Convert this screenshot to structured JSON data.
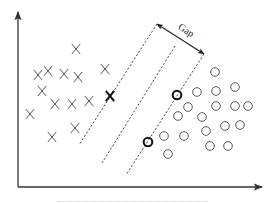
{
  "figure": {
    "type": "svm-hard-margin-diagram",
    "gap_label": "Gap",
    "caption_visible": "cropped, illegible",
    "colors": {
      "ink": "#222222",
      "axis": "#333333",
      "dashed": "#333333",
      "background": "#ffffff"
    },
    "axes": {
      "origin": [
        18,
        187
      ],
      "x_end": [
        262,
        187
      ],
      "y_end": [
        18,
        12
      ]
    },
    "class_x_points": [
      {
        "x": 76,
        "y": 49
      },
      {
        "x": 48,
        "y": 71
      },
      {
        "x": 38,
        "y": 75
      },
      {
        "x": 64,
        "y": 74
      },
      {
        "x": 78,
        "y": 77
      },
      {
        "x": 105,
        "y": 69
      },
      {
        "x": 42,
        "y": 91
      },
      {
        "x": 55,
        "y": 104
      },
      {
        "x": 72,
        "y": 104
      },
      {
        "x": 89,
        "y": 101
      },
      {
        "x": 30,
        "y": 114
      },
      {
        "x": 52,
        "y": 137
      },
      {
        "x": 75,
        "y": 128
      }
    ],
    "support_vector_x": [
      {
        "x": 110,
        "y": 96
      }
    ],
    "class_o_points": [
      {
        "x": 215,
        "y": 72
      },
      {
        "x": 197,
        "y": 92
      },
      {
        "x": 216,
        "y": 91
      },
      {
        "x": 235,
        "y": 87
      },
      {
        "x": 188,
        "y": 107
      },
      {
        "x": 216,
        "y": 106
      },
      {
        "x": 235,
        "y": 106
      },
      {
        "x": 248,
        "y": 106
      },
      {
        "x": 178,
        "y": 116
      },
      {
        "x": 202,
        "y": 117
      },
      {
        "x": 206,
        "y": 131
      },
      {
        "x": 225,
        "y": 126
      },
      {
        "x": 240,
        "y": 125
      },
      {
        "x": 164,
        "y": 136
      },
      {
        "x": 184,
        "y": 136
      },
      {
        "x": 210,
        "y": 146
      },
      {
        "x": 228,
        "y": 146
      },
      {
        "x": 168,
        "y": 154
      }
    ],
    "support_vector_o": [
      {
        "x": 177,
        "y": 95
      },
      {
        "x": 148,
        "y": 142
      }
    ],
    "lines": {
      "left_margin": {
        "x1": 157,
        "y1": 24,
        "x2": 79,
        "y2": 145
      },
      "separator": {
        "x1": 175,
        "y1": 46,
        "x2": 102,
        "y2": 163
      },
      "right_margin": {
        "x1": 204,
        "y1": 54,
        "x2": 126,
        "y2": 175
      }
    },
    "gap_arrow": {
      "x1": 157,
      "y1": 24,
      "x2": 204,
      "y2": 54
    }
  }
}
